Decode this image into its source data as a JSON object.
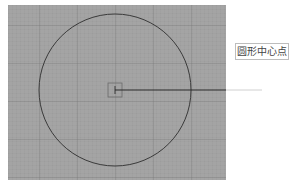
{
  "diagram": {
    "label": "圆形中心点",
    "colors": {
      "canvas": "#a4a4a4",
      "circle_stroke": "#3a3a3a",
      "leader_line": "#2a2a2a",
      "label_border": "#bdbdbd"
    },
    "circle": {
      "cx": 115,
      "cy": 90,
      "r": 76
    },
    "center_marker": {
      "x": 108,
      "y": 83,
      "size": 14
    },
    "leader": {
      "x1": 115,
      "y1": 90,
      "x2": 262,
      "y2": 90
    }
  }
}
